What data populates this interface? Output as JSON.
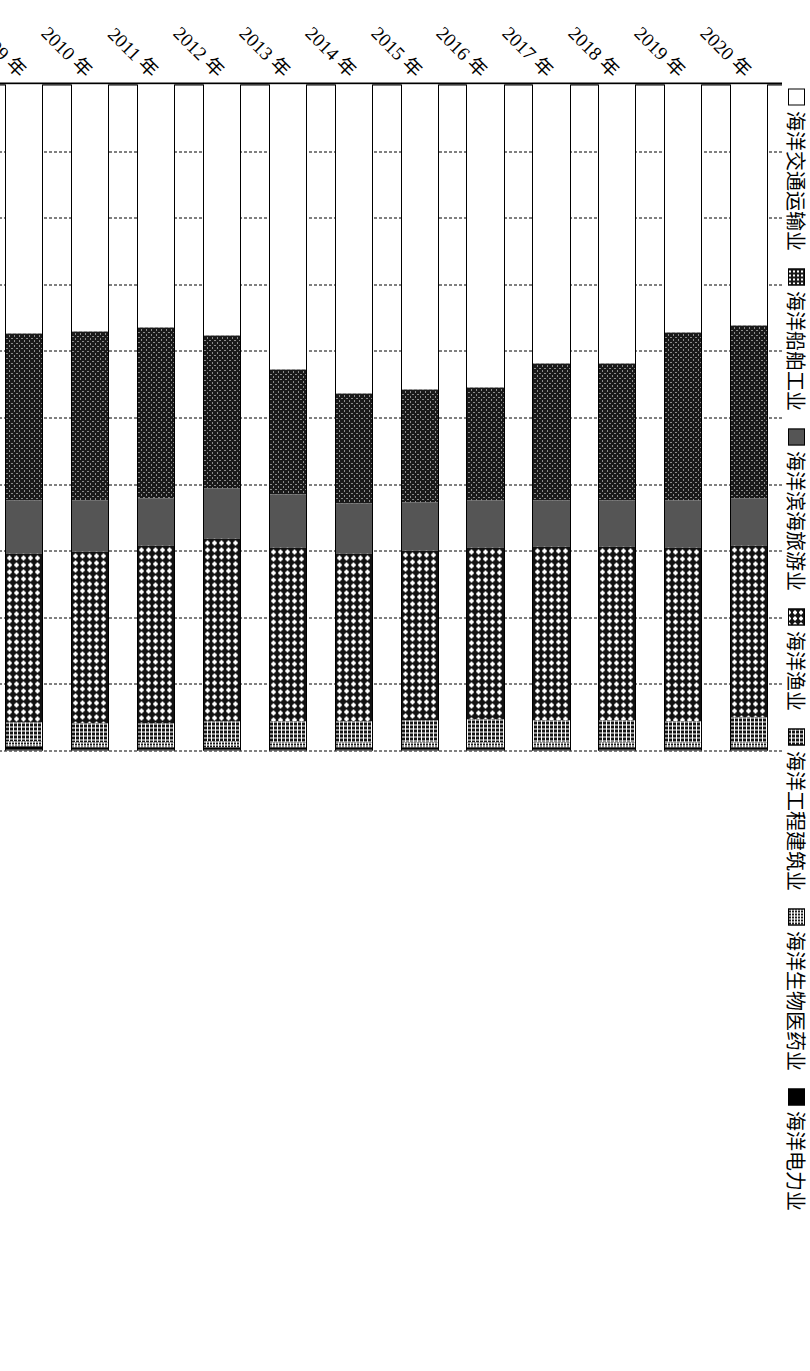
{
  "chart_data": {
    "type": "bar",
    "orientation": "horizontal",
    "stacked": "100%",
    "title": "",
    "xlabel": "",
    "ylabel": "",
    "xlim": [
      0,
      100
    ],
    "grid": true,
    "legend_position": "top",
    "x_tick_labels": [
      "0",
      "10%",
      "20%",
      "30%",
      "40%",
      "50%",
      "60%",
      "70%",
      "80%",
      "90%",
      "100%"
    ],
    "x_tick_values": [
      0,
      10,
      20,
      30,
      40,
      50,
      60,
      70,
      80,
      90,
      100
    ],
    "categories": [
      "2001 年",
      "2002 年",
      "2003 年",
      "2004 年",
      "2005 年",
      "2006 年",
      "2007 年",
      "2008 年",
      "2009 年",
      "2010 年",
      "2011 年",
      "2012 年",
      "2013 年",
      "2014 年",
      "2015 年",
      "2016 年",
      "2017 年",
      "2018 年",
      "2019 年",
      "2020 年"
    ],
    "series": [
      {
        "name": "海洋交通运输业",
        "pattern": "hollow",
        "values": [
          62.7,
          63.0,
          58.0,
          52.5,
          45.3,
          45.8,
          42.3,
          40.0,
          37.5,
          37.2,
          36.5,
          37.8,
          42.8,
          46.5,
          45.8,
          45.5,
          42.0,
          42.0,
          37.3,
          36.2
        ]
      },
      {
        "name": "海洋船舶工业",
        "pattern": "dark-dots",
        "values": [
          1.5,
          1.7,
          5.0,
          9.5,
          17.5,
          16.3,
          20.3,
          22.5,
          25.0,
          25.3,
          25.8,
          23.0,
          18.8,
          16.5,
          17.0,
          17.0,
          20.5,
          20.5,
          25.3,
          26.0
        ]
      },
      {
        "name": "海洋滨海旅游业",
        "pattern": "solid-gray",
        "values": [
          8.5,
          9.3,
          9.3,
          8.3,
          8.8,
          9.5,
          7.5,
          7.5,
          8.0,
          7.8,
          7.0,
          7.5,
          8.0,
          7.5,
          7.3,
          7.2,
          7.0,
          7.0,
          7.0,
          7.2
        ]
      },
      {
        "name": "海洋渔业",
        "pattern": "white-dots",
        "values": [
          25.8,
          24.2,
          25.8,
          27.0,
          25.7,
          25.6,
          26.8,
          26.7,
          25.5,
          25.8,
          26.8,
          27.5,
          26.2,
          25.3,
          25.5,
          25.8,
          26.2,
          26.2,
          26.2,
          25.8
        ]
      },
      {
        "name": "海洋工程建筑业",
        "pattern": "checker",
        "values": [
          0.9,
          1.0,
          1.1,
          1.6,
          1.7,
          1.8,
          2.0,
          2.2,
          2.8,
          2.8,
          2.8,
          3.0,
          3.2,
          3.2,
          3.4,
          3.5,
          3.3,
          3.3,
          3.2,
          3.8
        ]
      },
      {
        "name": "海洋生物医药业",
        "pattern": "fine-checker",
        "values": [
          0.4,
          0.5,
          0.5,
          0.7,
          0.7,
          0.7,
          0.8,
          0.8,
          0.8,
          0.8,
          0.8,
          0.9,
          0.7,
          0.7,
          0.7,
          0.7,
          0.7,
          0.7,
          0.7,
          0.7
        ]
      },
      {
        "name": "海洋电力业",
        "pattern": "solid-black",
        "values": [
          0.2,
          0.3,
          0.3,
          0.4,
          0.3,
          0.3,
          0.3,
          0.3,
          0.4,
          0.3,
          0.3,
          0.3,
          0.3,
          0.3,
          0.3,
          0.3,
          0.3,
          0.3,
          0.3,
          0.3
        ]
      }
    ]
  },
  "legend": {
    "items": [
      {
        "label": "海洋交通运输业"
      },
      {
        "label": "海洋船舶工业"
      },
      {
        "label": "海洋滨海旅游业"
      },
      {
        "label": "海洋渔业"
      },
      {
        "label": "海洋工程建筑业"
      },
      {
        "label": "海洋生物医药业"
      },
      {
        "label": "海洋电力业"
      }
    ]
  },
  "colors": {
    "axis": "#000000",
    "gridline": "#000000",
    "tourism_gray": "#555555",
    "electricity_black": "#000000",
    "background": "#ffffff"
  }
}
